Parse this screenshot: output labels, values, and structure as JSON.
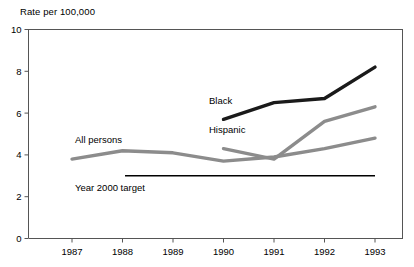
{
  "chart_data": {
    "type": "line",
    "title": "",
    "ylabel": "Rate per 100,000",
    "xlabel": "",
    "x": [
      1987,
      1988,
      1989,
      1990,
      1991,
      1992,
      1993
    ],
    "xticklabels": [
      "1987",
      "1988",
      "1989",
      "1990",
      "1991",
      "1992",
      "1993"
    ],
    "yticklabels": [
      "0",
      "2",
      "4",
      "6",
      "8",
      "10"
    ],
    "yticks": [
      0,
      2,
      4,
      6,
      8,
      10
    ],
    "ylim": [
      0,
      10
    ],
    "xlim": [
      1987,
      1993
    ],
    "grid": false,
    "legend": "inline-labels",
    "series": [
      {
        "name": "All persons",
        "color": "#8c8c8c",
        "x": [
          1987,
          1988,
          1989,
          1990,
          1991,
          1992,
          1993
        ],
        "values": [
          3.8,
          4.2,
          4.1,
          3.7,
          3.9,
          4.3,
          4.8
        ]
      },
      {
        "name": "Black",
        "color": "#1a1a1a",
        "x": [
          1990,
          1991,
          1992,
          1993
        ],
        "values": [
          5.7,
          6.5,
          6.7,
          8.2
        ]
      },
      {
        "name": "Hispanic",
        "color": "#8c8c8c",
        "x": [
          1990,
          1991,
          1992,
          1993
        ],
        "values": [
          4.3,
          3.8,
          5.6,
          6.3
        ]
      }
    ],
    "annotations": [
      {
        "name": "Year 2000 target",
        "label": "Year 2000 target",
        "value": 3.0,
        "color": "#000000",
        "x_start": 1988.05,
        "x_end": 1993.0
      }
    ]
  },
  "axis": {
    "y_title": "Rate per 100,000",
    "y_labels": [
      "10",
      "8",
      "6",
      "4",
      "2",
      "0"
    ],
    "x_labels": [
      "1987",
      "1988",
      "1989",
      "1990",
      "1991",
      "1992",
      "1993"
    ]
  },
  "labels": {
    "all_persons": "All persons",
    "black": "Black",
    "hispanic": "Hispanic",
    "target": "Year 2000 target"
  },
  "colors": {
    "all_persons": "#8c8c8c",
    "black": "#1a1a1a",
    "hispanic": "#8c8c8c",
    "target_line": "#000000",
    "axis": "#555555"
  }
}
